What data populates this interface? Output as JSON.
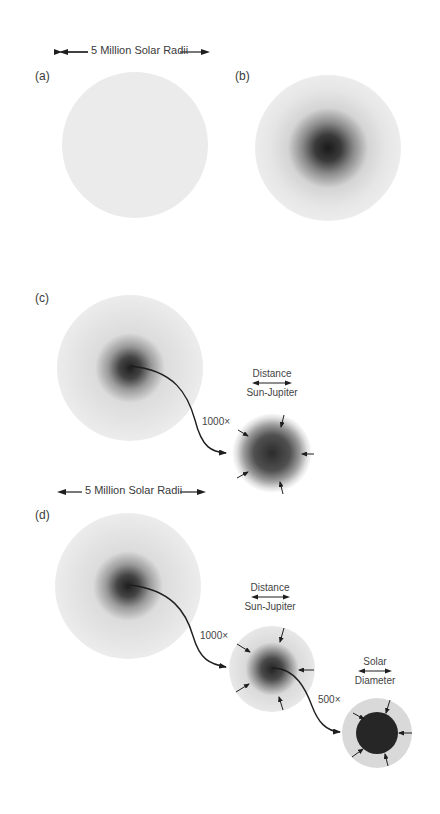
{
  "figure": {
    "scale_bar_top": "5 Million Solar Radii",
    "scale_bar_middle": "5 Million Solar Radii",
    "panels": [
      {
        "id": "a",
        "label": "(a)"
      },
      {
        "id": "b",
        "label": "(b)"
      },
      {
        "id": "c",
        "label": "(c)",
        "magnification": "1000×",
        "inset_caption_top": "Distance",
        "inset_caption_bottom": "Sun-Jupiter"
      },
      {
        "id": "d",
        "label": "(d)",
        "magnification_1": "1000×",
        "inset1_caption_top": "Distance",
        "inset1_caption_bottom": "Sun-Jupiter",
        "magnification_2": "500×",
        "inset2_caption_top": "Solar",
        "inset2_caption_bottom": "Diameter"
      }
    ]
  },
  "colors": {
    "background": "#ffffff",
    "cloud_light": "#ececec",
    "cloud_dark": "#2a2a2a",
    "arrow": "#1e1e1e"
  }
}
